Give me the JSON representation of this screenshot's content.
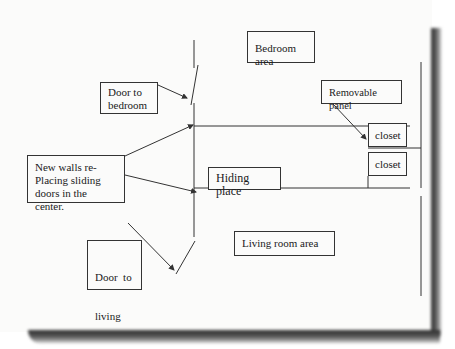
{
  "diagram": {
    "type": "floor-plan sketch",
    "labels": {
      "bedroom_area": "Bedroom area",
      "door_to_bedroom": "Door to bedroom",
      "removable_panel": "Removable panel",
      "closet_top": "closet",
      "closet_bottom": "closet",
      "new_walls": "New walls re-Placing sliding doors in the center.",
      "new_walls_lines": [
        "New walls re-",
        "Placing sliding",
        "doors in the center."
      ],
      "hiding_place": "Hiding place",
      "living_room_area": "Living room area",
      "door_to_living_room_lines": [
        "Door  to",
        "living",
        "room"
      ],
      "door_to_bedroom_lines": [
        "Door to",
        "bedroom"
      ]
    },
    "colors": {
      "ink": "#333333",
      "paper": "#fbfbfa",
      "shadow": "#333333"
    }
  }
}
